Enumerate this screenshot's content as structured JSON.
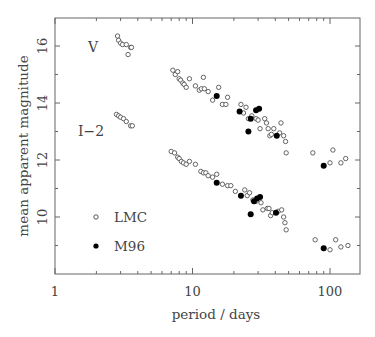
{
  "chart_data": {
    "type": "scatter",
    "title": "",
    "xlabel": "period / days",
    "ylabel": "mean apparent magnitude",
    "xscale": "log",
    "xlim": [
      1,
      160
    ],
    "ylim": [
      8,
      17
    ],
    "x_ticks": [
      1,
      10,
      100
    ],
    "x_tick_labels": [
      "1",
      "10",
      "100"
    ],
    "y_ticks": [
      10,
      12,
      14,
      16
    ],
    "y_tick_labels": [
      "10",
      "12",
      "14",
      "16"
    ],
    "grid": false,
    "legend_position": "lower-left inside",
    "legend": [
      {
        "label": "LMC",
        "marker": "open-circle"
      },
      {
        "label": "M96",
        "marker": "filled-circle"
      }
    ],
    "annotations": [
      {
        "text": "V",
        "x": 2.0,
        "y": 15.7
      },
      {
        "text": "I−2",
        "x": 1.85,
        "y": 13.0
      }
    ],
    "series": [
      {
        "name": "LMC V",
        "marker": "open-circle",
        "points": [
          [
            2.85,
            16.35
          ],
          [
            2.9,
            16.2
          ],
          [
            3.0,
            16.1
          ],
          [
            3.1,
            16.05
          ],
          [
            3.3,
            16.05
          ],
          [
            3.55,
            15.95
          ],
          [
            3.6,
            15.95
          ],
          [
            3.4,
            15.7
          ],
          [
            7.2,
            15.15
          ],
          [
            7.5,
            15.0
          ],
          [
            7.8,
            15.1
          ],
          [
            8.0,
            14.85
          ],
          [
            8.2,
            14.8
          ],
          [
            8.5,
            14.7
          ],
          [
            8.7,
            14.65
          ],
          [
            9.0,
            14.55
          ],
          [
            9.5,
            14.85
          ],
          [
            10.5,
            14.6
          ],
          [
            11.2,
            14.45
          ],
          [
            11.6,
            14.5
          ],
          [
            12.0,
            14.9
          ],
          [
            12.2,
            14.5
          ],
          [
            13.0,
            14.4
          ],
          [
            14.0,
            14.1
          ],
          [
            15.5,
            14.55
          ],
          [
            16.5,
            13.95
          ],
          [
            17.5,
            13.95
          ],
          [
            18.0,
            14.2
          ],
          [
            22.5,
            13.95
          ],
          [
            23.5,
            13.65
          ],
          [
            24.5,
            13.85
          ],
          [
            25.5,
            13.45
          ],
          [
            27.0,
            13.55
          ],
          [
            29.0,
            13.45
          ],
          [
            30.0,
            13.4
          ],
          [
            31.0,
            13.1
          ],
          [
            33.5,
            13.45
          ],
          [
            34.5,
            13.3
          ],
          [
            35.5,
            13.1
          ],
          [
            36.5,
            12.85
          ],
          [
            37.5,
            12.9
          ],
          [
            39.0,
            13.1
          ],
          [
            43.0,
            12.95
          ],
          [
            44.0,
            13.3
          ],
          [
            46.0,
            12.85
          ],
          [
            47.5,
            12.65
          ],
          [
            48.0,
            12.25
          ],
          [
            75.0,
            12.25
          ],
          [
            100.0,
            11.9
          ],
          [
            105.0,
            12.35
          ],
          [
            120.0,
            11.9
          ],
          [
            130.0,
            12.05
          ]
        ]
      },
      {
        "name": "M96 V",
        "marker": "filled-circle",
        "points": [
          [
            15.0,
            14.25
          ],
          [
            22.0,
            13.7
          ],
          [
            26.5,
            13.45
          ],
          [
            29.0,
            13.75
          ],
          [
            30.5,
            13.8
          ],
          [
            25.5,
            13.0
          ],
          [
            41.0,
            12.85
          ],
          [
            90.0,
            11.8
          ]
        ]
      },
      {
        "name": "LMC I-2",
        "marker": "open-circle",
        "points": [
          [
            2.8,
            13.6
          ],
          [
            2.9,
            13.55
          ],
          [
            3.0,
            13.5
          ],
          [
            3.15,
            13.45
          ],
          [
            3.3,
            13.35
          ],
          [
            3.55,
            13.2
          ],
          [
            3.65,
            13.2
          ],
          [
            7.0,
            12.3
          ],
          [
            7.4,
            12.25
          ],
          [
            7.8,
            12.1
          ],
          [
            8.0,
            12.05
          ],
          [
            8.3,
            11.95
          ],
          [
            8.6,
            11.9
          ],
          [
            9.0,
            11.85
          ],
          [
            9.5,
            11.95
          ],
          [
            10.5,
            11.85
          ],
          [
            11.5,
            11.6
          ],
          [
            12.0,
            11.55
          ],
          [
            12.5,
            11.55
          ],
          [
            13.0,
            11.45
          ],
          [
            14.0,
            11.4
          ],
          [
            15.0,
            11.5
          ],
          [
            16.5,
            11.15
          ],
          [
            18.0,
            11.1
          ],
          [
            19.0,
            11.1
          ],
          [
            20.5,
            10.9
          ],
          [
            24.0,
            10.95
          ],
          [
            25.0,
            10.75
          ],
          [
            26.0,
            10.85
          ],
          [
            27.5,
            10.6
          ],
          [
            29.0,
            10.55
          ],
          [
            31.5,
            10.5
          ],
          [
            32.5,
            10.25
          ],
          [
            35.0,
            10.3
          ],
          [
            36.0,
            10.3
          ],
          [
            37.0,
            10.05
          ],
          [
            38.0,
            10.15
          ],
          [
            42.0,
            10.2
          ],
          [
            44.5,
            10.25
          ],
          [
            46.0,
            10.0
          ],
          [
            47.0,
            9.8
          ],
          [
            48.0,
            9.55
          ],
          [
            78.0,
            9.2
          ],
          [
            100.0,
            8.85
          ],
          [
            110.0,
            9.2
          ],
          [
            120.0,
            8.95
          ],
          [
            135.0,
            9.0
          ]
        ]
      },
      {
        "name": "M96 I-2",
        "marker": "filled-circle",
        "points": [
          [
            15.0,
            11.2
          ],
          [
            22.5,
            10.75
          ],
          [
            28.0,
            10.55
          ],
          [
            29.5,
            10.65
          ],
          [
            31.0,
            10.7
          ],
          [
            26.5,
            10.1
          ],
          [
            40.5,
            10.15
          ],
          [
            90.0,
            8.9
          ]
        ]
      }
    ]
  },
  "legend": {
    "items": [
      {
        "label": "LMC"
      },
      {
        "label": "M96"
      }
    ]
  },
  "axes": {
    "xlabel": "period / days",
    "ylabel": "mean apparent magnitude"
  },
  "annotations": {
    "v_label": "V",
    "i_label": "I−2"
  }
}
